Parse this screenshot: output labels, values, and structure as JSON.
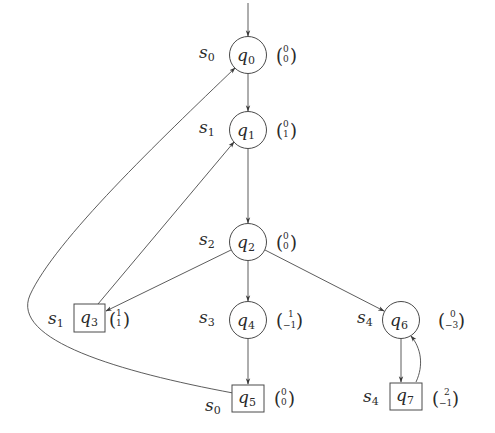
{
  "diagram": {
    "type": "game-graph",
    "colors": {
      "stroke": "#4a4a4a",
      "text": "#2a2a2a",
      "background": "#ffffff"
    },
    "nodes": [
      {
        "id": "q0",
        "name": "q",
        "index": "0",
        "shape": "circle",
        "state": "s",
        "state_index": "0",
        "vector": [
          "0",
          "0"
        ],
        "initial": true
      },
      {
        "id": "q1",
        "name": "q",
        "index": "1",
        "shape": "circle",
        "state": "s",
        "state_index": "1",
        "vector": [
          "0",
          "1"
        ]
      },
      {
        "id": "q2",
        "name": "q",
        "index": "2",
        "shape": "circle",
        "state": "s",
        "state_index": "2",
        "vector": [
          "0",
          "0"
        ]
      },
      {
        "id": "q3",
        "name": "q",
        "index": "3",
        "shape": "box",
        "state": "s",
        "state_index": "1",
        "vector": [
          "1",
          "1"
        ]
      },
      {
        "id": "q4",
        "name": "q",
        "index": "4",
        "shape": "circle",
        "state": "s",
        "state_index": "3",
        "vector": [
          "1",
          "−1"
        ]
      },
      {
        "id": "q5",
        "name": "q",
        "index": "5",
        "shape": "box",
        "state": "s",
        "state_index": "0",
        "vector": [
          "0",
          "0"
        ]
      },
      {
        "id": "q6",
        "name": "q",
        "index": "6",
        "shape": "circle",
        "state": "s",
        "state_index": "4",
        "vector": [
          "0",
          "−3"
        ]
      },
      {
        "id": "q7",
        "name": "q",
        "index": "7",
        "shape": "box",
        "state": "s",
        "state_index": "4",
        "vector": [
          "2",
          "−1"
        ]
      }
    ],
    "edges": [
      {
        "from": "start",
        "to": "q0"
      },
      {
        "from": "q0",
        "to": "q1"
      },
      {
        "from": "q1",
        "to": "q2"
      },
      {
        "from": "q2",
        "to": "q3"
      },
      {
        "from": "q2",
        "to": "q4"
      },
      {
        "from": "q2",
        "to": "q6"
      },
      {
        "from": "q3",
        "to": "q1"
      },
      {
        "from": "q4",
        "to": "q5"
      },
      {
        "from": "q5",
        "to": "q0"
      },
      {
        "from": "q6",
        "to": "q7"
      },
      {
        "from": "q7",
        "to": "q6"
      }
    ]
  }
}
